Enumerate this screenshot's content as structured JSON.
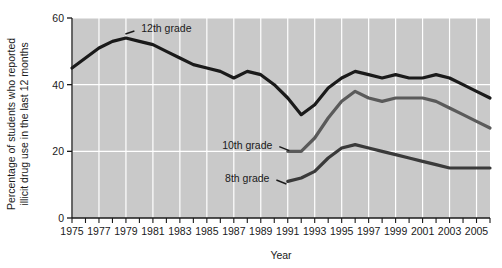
{
  "chart_data": {
    "type": "line",
    "title": "",
    "xlabel": "Year",
    "ylabel": "Percentage of students who reported illicit drug use in the last 12 months",
    "ylabel_line1": "Percentage of students who reported",
    "ylabel_line2": "illicit drug use in the last 12 months",
    "xlim": [
      1975,
      2006
    ],
    "ylim": [
      0,
      60
    ],
    "yticks": [
      0,
      20,
      40,
      60
    ],
    "yticklabels": [
      "0",
      "20",
      "40",
      "60"
    ],
    "xticks": [
      1975,
      1976,
      1977,
      1978,
      1979,
      1980,
      1981,
      1982,
      1983,
      1984,
      1985,
      1986,
      1987,
      1988,
      1989,
      1990,
      1991,
      1992,
      1993,
      1994,
      1995,
      1996,
      1997,
      1998,
      1999,
      2000,
      2001,
      2002,
      2003,
      2004,
      2005,
      2006
    ],
    "xticklabels_shown": [
      "1975",
      "1977",
      "1979",
      "1981",
      "1983",
      "1985",
      "1987",
      "1989",
      "1991",
      "1993",
      "1995",
      "1997",
      "1999",
      "2001",
      "2003",
      "2005"
    ],
    "grid": "vertical-and-horizontal-white-on-gray",
    "legend_position": "inline-annotations",
    "plot_background": "#c9c9c9",
    "gridline_color": "#ffffff",
    "series": [
      {
        "name": "12th grade",
        "color": "#1a1a1a",
        "label_x": 1982,
        "label_y": 57,
        "x": [
          1975,
          1976,
          1977,
          1978,
          1979,
          1980,
          1981,
          1982,
          1983,
          1984,
          1985,
          1986,
          1987,
          1988,
          1989,
          1990,
          1991,
          1992,
          1993,
          1994,
          1995,
          1996,
          1997,
          1998,
          1999,
          2000,
          2001,
          2002,
          2003,
          2004,
          2005,
          2006
        ],
        "values": [
          45,
          48,
          51,
          53,
          54,
          53,
          52,
          50,
          48,
          46,
          45,
          44,
          42,
          44,
          43,
          40,
          36,
          31,
          34,
          39,
          42,
          44,
          43,
          42,
          43,
          42,
          42,
          43,
          42,
          40,
          38,
          36
        ]
      },
      {
        "name": "10th grade",
        "color": "#5a5a5a",
        "label_x": 1988,
        "label_y": 22,
        "x": [
          1991,
          1992,
          1993,
          1994,
          1995,
          1996,
          1997,
          1998,
          1999,
          2000,
          2001,
          2002,
          2003,
          2004,
          2005,
          2006
        ],
        "values": [
          20,
          20,
          24,
          30,
          35,
          38,
          36,
          35,
          36,
          36,
          36,
          35,
          33,
          31,
          29,
          27
        ]
      },
      {
        "name": "8th grade",
        "color": "#3a3a3a",
        "label_x": 1988,
        "label_y": 12,
        "x": [
          1991,
          1992,
          1993,
          1994,
          1995,
          1996,
          1997,
          1998,
          1999,
          2000,
          2001,
          2002,
          2003,
          2004,
          2005,
          2006
        ],
        "values": [
          11,
          12,
          14,
          18,
          21,
          22,
          21,
          20,
          19,
          18,
          17,
          16,
          15,
          15,
          15,
          15
        ]
      }
    ]
  }
}
